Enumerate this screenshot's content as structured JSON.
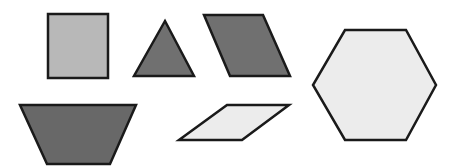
{
  "canvas": {
    "width": 450,
    "height": 167,
    "background_color": "#ffffff",
    "description": "Six outlined geometric polygons arranged in two rows on a plain white background"
  },
  "palette": {
    "outline": "#1a1a1a",
    "fill_light": "#ececec",
    "fill_medium": "#b8b8b8",
    "fill_dark": "#707070",
    "fill_dark_alt": "#686868"
  },
  "shapes": [
    {
      "id": "square",
      "name": "square",
      "sides": 4,
      "fill_color": "#b8b8b8",
      "stroke_color": "#1a1a1a",
      "stroke_width": 2.5,
      "row": "top",
      "order": 1,
      "points": "48,14 108,14 108,78 48,78"
    },
    {
      "id": "triangle",
      "name": "triangle",
      "sides": 3,
      "fill_color": "#707070",
      "stroke_color": "#1a1a1a",
      "stroke_width": 2.5,
      "row": "top",
      "order": 2,
      "points": "165,21 194,76 134,76"
    },
    {
      "id": "rhombus",
      "name": "rhombus",
      "sides": 4,
      "fill_color": "#707070",
      "stroke_color": "#1a1a1a",
      "stroke_width": 2.5,
      "row": "top",
      "order": 3,
      "points": "204,15 263,15 290,76 230,76"
    },
    {
      "id": "hexagon",
      "name": "hexagon",
      "sides": 6,
      "fill_color": "#ececec",
      "stroke_color": "#1a1a1a",
      "stroke_width": 2.5,
      "row": "right",
      "order": 4,
      "points": "345,30 406,30 436,85 406,140 345,140 313,85"
    },
    {
      "id": "trapezoid",
      "name": "trapezoid",
      "sides": 4,
      "fill_color": "#686868",
      "stroke_color": "#1a1a1a",
      "stroke_width": 2.5,
      "row": "bottom",
      "order": 5,
      "points": "20,105 136,105 110,164 47,164"
    },
    {
      "id": "parallelogram",
      "name": "parallelogram",
      "sides": 4,
      "fill_color": "#ececec",
      "stroke_color": "#1a1a1a",
      "stroke_width": 2.5,
      "row": "bottom",
      "order": 6,
      "points": "227,105 289,105 242,140 179,140"
    }
  ]
}
